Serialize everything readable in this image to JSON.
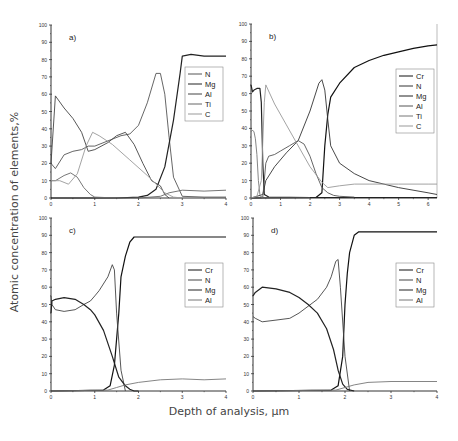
{
  "figure": {
    "ylabel": "Atomic concentration of elements,%",
    "xlabel": "Depth of analysis, μm"
  },
  "chart_data": [
    {
      "type": "line",
      "panel_label": "a)",
      "xlabel": "Depth of analysis, μm",
      "ylabel": "Atomic concentration of elements,%",
      "xlim": [
        0,
        4
      ],
      "ylim": [
        0,
        100
      ],
      "xticks": [
        0,
        1,
        2,
        3,
        4
      ],
      "yticks": [
        0,
        10,
        20,
        30,
        40,
        50,
        60,
        70,
        80,
        90,
        100
      ],
      "grid": false,
      "legend_position": "right-middle",
      "legend": [
        "N",
        "Mg",
        "Al",
        "Ti",
        "C"
      ],
      "series": [
        {
          "name": "N",
          "color": "#555555",
          "x": [
            0,
            0.1,
            0.3,
            0.5,
            0.7,
            0.85,
            1.0,
            1.3,
            1.6,
            1.8,
            2.0,
            2.2,
            2.4,
            2.5,
            2.6,
            2.7,
            2.8,
            3.0,
            3.5,
            4.0
          ],
          "y": [
            20,
            17,
            25,
            27,
            28,
            30,
            30,
            33,
            36,
            37,
            42,
            55,
            72,
            72,
            60,
            35,
            12,
            1,
            0.5,
            0.5
          ]
        },
        {
          "name": "Mg",
          "color": "#222222",
          "x": [
            0,
            1.5,
            2.0,
            2.2,
            2.4,
            2.6,
            2.8,
            2.95,
            3.0,
            3.2,
            3.5,
            4.0
          ],
          "y": [
            0,
            0,
            0.5,
            1.5,
            5,
            18,
            45,
            72,
            82,
            83,
            82,
            82
          ]
        },
        {
          "name": "Al",
          "color": "#444444",
          "x": [
            0,
            0.1,
            0.3,
            0.5,
            0.7,
            0.85,
            1.0,
            1.3,
            1.5,
            1.7,
            1.9,
            2.1,
            2.3,
            2.5,
            2.6,
            2.7
          ],
          "y": [
            20,
            59,
            52,
            46,
            38,
            27,
            28,
            32,
            36,
            38,
            31,
            20,
            10,
            7,
            2,
            0
          ]
        },
        {
          "name": "Ti",
          "color": "#666666",
          "x": [
            0,
            0.1,
            0.3,
            0.45,
            0.6,
            0.75,
            0.9,
            1.0,
            1.5,
            2.0,
            2.5,
            2.7,
            3.0,
            3.5,
            4.0
          ],
          "y": [
            10,
            10,
            13,
            14.5,
            12,
            6,
            2,
            0.5,
            0,
            0,
            1,
            3,
            4.5,
            4,
            4.5
          ]
        },
        {
          "name": "C",
          "color": "#999999",
          "x": [
            0,
            0.2,
            0.4,
            0.6,
            0.8,
            0.95,
            1.1,
            1.4,
            1.8,
            2.2,
            2.6,
            2.8,
            3.0
          ],
          "y": [
            10,
            10,
            8,
            14,
            30,
            38,
            36,
            31,
            22,
            13,
            3,
            0.5,
            0
          ]
        }
      ]
    },
    {
      "type": "line",
      "panel_label": "b)",
      "xlabel": "Depth of analysis, μm",
      "ylabel": "Atomic concentration of elements,%",
      "xlim": [
        0,
        6.3
      ],
      "ylim": [
        0,
        100
      ],
      "xticks": [
        0,
        1,
        2,
        3,
        4,
        5,
        6
      ],
      "yticks": [
        0,
        10,
        20,
        30,
        40,
        50,
        60,
        70,
        80,
        90,
        100
      ],
      "grid": false,
      "legend_position": "right-middle",
      "legend": [
        "Cr",
        "N",
        "Mg",
        "Al",
        "Ti",
        "C"
      ],
      "series": [
        {
          "name": "Cr",
          "color": "#111111",
          "x": [
            0,
            2.2,
            2.4,
            2.5,
            2.6,
            2.7,
            3.0,
            3.5,
            4.0,
            4.5,
            5.0,
            5.5,
            6.0,
            6.3
          ],
          "y": [
            0,
            0.3,
            3,
            30,
            48,
            58,
            66,
            75,
            79,
            82,
            84,
            86,
            87.5,
            88
          ]
        },
        {
          "name": "N",
          "color": "#333333",
          "x": [
            0,
            0.4,
            0.5,
            0.8,
            1.2,
            1.6,
            2.0,
            2.3,
            2.4,
            2.5,
            2.6,
            2.7,
            3.0,
            3.5,
            4.0,
            5.0,
            6.0,
            6.3
          ],
          "y": [
            0,
            2,
            10,
            18,
            26,
            33,
            50,
            66,
            68,
            62,
            45,
            30,
            20,
            14,
            10,
            6,
            3,
            2
          ]
        },
        {
          "name": "Mg",
          "color": "#222222",
          "x": [
            0,
            0.05,
            0.1,
            0.2,
            0.3,
            0.35,
            0.4,
            0.45,
            0.6,
            2.0,
            4.0,
            6.3
          ],
          "y": [
            65,
            61,
            62,
            63,
            63,
            55,
            20,
            2,
            0.5,
            0.3,
            0.3,
            0.3
          ]
        },
        {
          "name": "Al",
          "color": "#555555",
          "x": [
            0,
            0.4,
            0.5,
            0.6,
            0.8,
            1.0,
            1.3,
            1.6,
            1.8,
            2.0,
            2.2,
            2.4,
            2.6,
            2.8,
            3.0,
            3.5
          ],
          "y": [
            0,
            0.5,
            20,
            24,
            25,
            27,
            30,
            33,
            31,
            24,
            14,
            6,
            3,
            1.5,
            1,
            0.5
          ]
        },
        {
          "name": "Ti",
          "color": "#777777",
          "x": [
            0,
            0.05,
            0.1,
            0.15,
            0.2,
            0.25,
            0.3,
            0.35,
            0.4,
            0.6,
            1.0,
            2.0
          ],
          "y": [
            38,
            39,
            38,
            34,
            25,
            10,
            2,
            0.5,
            0,
            0,
            0,
            0
          ]
        },
        {
          "name": "C",
          "color": "#999999",
          "x": [
            0,
            0.2,
            0.35,
            0.45,
            0.5,
            0.8,
            1.2,
            1.6,
            2.0,
            2.4,
            2.6,
            3.0,
            3.5,
            4.0,
            5.0,
            6.0,
            6.3
          ],
          "y": [
            0,
            1,
            10,
            55,
            65,
            54,
            42,
            30,
            18,
            9,
            6,
            7,
            8,
            8,
            8,
            8,
            8
          ]
        }
      ]
    },
    {
      "type": "line",
      "panel_label": "c)",
      "xlabel": "Depth of analysis, μm",
      "ylabel": "Atomic concentration of elements,%",
      "xlim": [
        0,
        4
      ],
      "ylim": [
        0,
        100
      ],
      "xticks": [
        0,
        1,
        2,
        3,
        4
      ],
      "yticks": [
        0,
        10,
        20,
        30,
        40,
        50,
        60,
        70,
        80,
        90,
        100
      ],
      "grid": false,
      "legend_position": "right-middle",
      "legend": [
        "Cr",
        "N",
        "Mg",
        "Al"
      ],
      "series": [
        {
          "name": "Cr",
          "color": "#111111",
          "x": [
            0,
            1.2,
            1.35,
            1.45,
            1.55,
            1.6,
            1.7,
            1.8,
            1.9,
            2.0,
            3.0,
            4.0
          ],
          "y": [
            0,
            0.5,
            3,
            15,
            45,
            66,
            78,
            86,
            89,
            89,
            89,
            89
          ]
        },
        {
          "name": "N",
          "color": "#444444",
          "x": [
            0,
            0.02,
            0.1,
            0.3,
            0.55,
            0.75,
            0.9,
            1.0,
            1.1,
            1.3,
            1.4,
            1.45,
            1.5,
            1.6,
            1.7
          ],
          "y": [
            55,
            50,
            47,
            46,
            47,
            50,
            52,
            55,
            58,
            66,
            73,
            70,
            45,
            12,
            0
          ]
        },
        {
          "name": "Mg",
          "color": "#222222",
          "x": [
            0,
            0.02,
            0.1,
            0.3,
            0.55,
            0.75,
            0.9,
            1.0,
            1.2,
            1.4,
            1.55,
            1.7,
            1.8,
            1.9,
            2.0
          ],
          "y": [
            45,
            52,
            53,
            54,
            53,
            50,
            47,
            44,
            35,
            20,
            8,
            3,
            1,
            0,
            0
          ]
        },
        {
          "name": "Al",
          "color": "#777777",
          "x": [
            0,
            1.3,
            1.5,
            1.7,
            2.0,
            2.5,
            3.0,
            3.5,
            4.0
          ],
          "y": [
            0,
            0.5,
            2,
            3.5,
            5,
            6.5,
            7,
            6.5,
            7
          ]
        }
      ]
    },
    {
      "type": "line",
      "panel_label": "d)",
      "xlabel": "Depth of analysis, μm",
      "ylabel": "Atomic concentration of elements,%",
      "xlim": [
        0,
        4
      ],
      "ylim": [
        0,
        100
      ],
      "xticks": [
        0,
        1,
        2,
        3,
        4
      ],
      "yticks": [
        0,
        10,
        20,
        30,
        40,
        50,
        60,
        70,
        80,
        90,
        100
      ],
      "grid": false,
      "legend_position": "right-middle",
      "legend": [
        "Cr",
        "N",
        "Mg",
        "Al"
      ],
      "series": [
        {
          "name": "Cr",
          "color": "#111111",
          "x": [
            0,
            1.7,
            1.85,
            1.95,
            2.0,
            2.05,
            2.1,
            2.2,
            2.3,
            3.0,
            4.0
          ],
          "y": [
            0,
            0.5,
            3,
            20,
            50,
            68,
            80,
            90,
            92,
            92,
            92
          ]
        },
        {
          "name": "N",
          "color": "#444444",
          "x": [
            0,
            0.05,
            0.2,
            0.5,
            0.8,
            1.0,
            1.2,
            1.4,
            1.6,
            1.7,
            1.8,
            1.85,
            1.9,
            2.0,
            2.1
          ],
          "y": [
            43,
            42,
            40,
            41,
            42,
            45,
            49,
            53,
            60,
            66,
            75,
            76,
            60,
            20,
            0
          ]
        },
        {
          "name": "Mg",
          "color": "#222222",
          "x": [
            0,
            0.05,
            0.2,
            0.5,
            0.8,
            1.0,
            1.2,
            1.4,
            1.6,
            1.75,
            1.85,
            1.95,
            2.05,
            2.2
          ],
          "y": [
            55,
            57,
            60,
            59,
            57,
            54,
            50,
            45,
            36,
            24,
            12,
            4,
            1,
            0
          ]
        },
        {
          "name": "Al",
          "color": "#777777",
          "x": [
            0,
            1.8,
            2.0,
            2.2,
            2.5,
            3.0,
            3.5,
            4.0
          ],
          "y": [
            0,
            0.5,
            2,
            3.5,
            5,
            5.5,
            5.5,
            5.5
          ]
        }
      ]
    }
  ]
}
